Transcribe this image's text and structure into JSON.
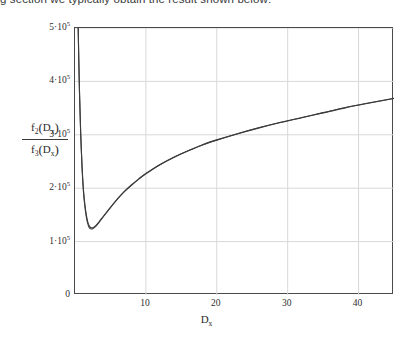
{
  "intro": {
    "text": "g section we typically obtain the result shown below:"
  },
  "chart_data": {
    "type": "line",
    "title": "",
    "subtitle": "",
    "xlabel": "D_x",
    "ylabel": "f2(Dx) / f3(Dx)",
    "xlim": [
      0,
      45
    ],
    "ylim": [
      0,
      500000
    ],
    "grid": true,
    "legend": null,
    "legend_position": "none",
    "x_tick_labels": [
      "10",
      "20",
      "30",
      "40"
    ],
    "x_tick_values": [
      10,
      20,
      30,
      40
    ],
    "y_tick_labels": [
      "0",
      "1·10⁵",
      "2·10⁵",
      "3·10⁵",
      "4·10⁵",
      "5·10⁵"
    ],
    "y_tick_values": [
      0,
      100000,
      200000,
      300000,
      400000,
      500000
    ],
    "axis_color": "#4a4a4a",
    "grid_color": "#d8d8d8",
    "curve_color": "#3c3c3c",
    "background": "#ffffff",
    "series": [
      {
        "name": "curve-upper",
        "x": [
          0.45,
          0.6,
          0.8,
          1.0,
          1.2,
          1.4,
          1.6,
          1.8,
          2.0,
          2.2,
          2.5,
          3.0,
          3.5,
          4.0,
          5.0,
          6.0,
          7.0,
          8.0,
          9.0,
          10.0,
          12.0,
          14.0,
          16.0,
          18.0,
          20.0,
          23.0,
          26.0,
          29.0,
          32.0,
          35.0,
          38.0,
          41.0,
          45.0
        ],
        "y": [
          500000,
          400000,
          305000,
          240000,
          196000,
          169000,
          150000,
          137000,
          129500,
          126500,
          126000,
          131000,
          139000,
          147500,
          164000,
          180000,
          194000,
          206000,
          217000,
          227000,
          244000,
          258000,
          270000,
          281000,
          290000,
          302000,
          313000,
          323000,
          332000,
          341000,
          350000,
          358000,
          368000
        ]
      },
      {
        "name": "curve-lower",
        "x": [
          0.45,
          0.6,
          0.8,
          1.0,
          1.2,
          1.4,
          1.6,
          1.8,
          2.0,
          2.2,
          2.5,
          3.0,
          3.5,
          4.0,
          5.0,
          6.0,
          7.0,
          8.0,
          9.0,
          10.0,
          12.0,
          14.0,
          16.0,
          18.0,
          20.0,
          23.0,
          26.0,
          29.0,
          32.0,
          35.0,
          38.0,
          41.0,
          45.0
        ],
        "y": [
          500000,
          398000,
          302000,
          236000,
          192000,
          165000,
          146000,
          133500,
          126500,
          124000,
          124000,
          129500,
          138000,
          146500,
          163500,
          180000,
          194500,
          206500,
          217500,
          227500,
          244500,
          258500,
          270500,
          281500,
          290500,
          302500,
          313500,
          323500,
          332500,
          341500,
          350500,
          358500,
          368500
        ]
      }
    ]
  },
  "labels": {
    "y_frac_numerator_fn": "f",
    "y_frac_numerator_sub": "2",
    "y_frac_numerator_arg": "D",
    "y_frac_numerator_arg_sub": "x",
    "y_frac_denominator_fn": "f",
    "y_frac_denominator_sub": "3",
    "y_frac_denominator_arg": "D",
    "y_frac_denominator_arg_sub": "x",
    "x_axis_main": "D",
    "x_axis_sub": "x"
  }
}
